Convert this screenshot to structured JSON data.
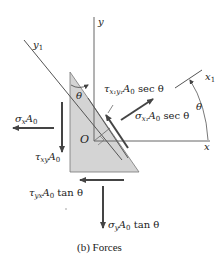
{
  "diagram": {
    "caption": "(b) Forces",
    "axes": {
      "x": "x",
      "y": "y",
      "x1": "x",
      "x1_sub": "1",
      "y1": "y",
      "y1_sub": "1",
      "origin": "O"
    },
    "angles": {
      "theta_top": "θ",
      "theta_arc": "θ"
    },
    "forces": {
      "sigma_x": {
        "sym": "σ",
        "sub": "x",
        "rest": "A",
        "rest_sub": "0",
        "tail": ""
      },
      "tau_xy": {
        "sym": "τ",
        "sub": "xy",
        "rest": "A",
        "rest_sub": "0",
        "tail": ""
      },
      "tau_yx": {
        "sym": "τ",
        "sub": "yx",
        "rest": "A",
        "rest_sub": "0",
        "tail": " tan θ"
      },
      "sigma_y": {
        "sym": "σ",
        "sub": "y",
        "rest": "A",
        "rest_sub": "0",
        "tail": " tan θ"
      },
      "tau_x1y1": {
        "sym": "τ",
        "sub": "x₁y₁",
        "rest": "A",
        "rest_sub": "0",
        "tail": " sec θ"
      },
      "sigma_x1": {
        "sym": "σ",
        "sub": "x₁",
        "rest": "A",
        "rest_sub": "0",
        "tail": " sec θ"
      }
    },
    "colors": {
      "element_fill": "#d4d4d4",
      "line": "#555555",
      "arrow": "#444444"
    }
  }
}
